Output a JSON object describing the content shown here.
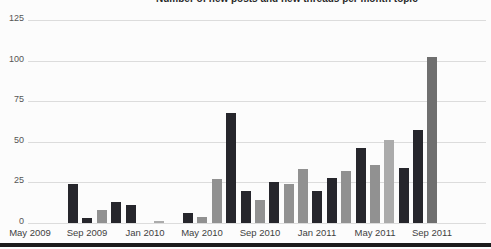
{
  "title_clipped": "Number of new posts and new threads per month topic",
  "colors": {
    "dark": "#26262c",
    "gray": "#919191",
    "lightgray": "#ababab",
    "darkgray": "#6f6f6f",
    "gridline": "#dcdcdc",
    "axis_text": "#555555",
    "bottom_bar": "#1b1b1b",
    "background": "#fcfcfc"
  },
  "chart_data": {
    "type": "bar",
    "ylabel": "",
    "xlabel": "",
    "ylim": [
      0,
      125
    ],
    "y_ticks": [
      0,
      25,
      50,
      75,
      100,
      125
    ],
    "grid": "horizontal",
    "legend": "none",
    "x_tick_labels": [
      "May 2009",
      "Sep 2009",
      "Jan 2010",
      "May 2010",
      "Sep 2010",
      "Jan 2011",
      "May 2011",
      "Sep 2011"
    ],
    "months": [
      {
        "label": "May 2009",
        "value": 0,
        "color": null
      },
      {
        "label": "Jun 2009",
        "value": 0,
        "color": null
      },
      {
        "label": "Jul 2009",
        "value": 0,
        "color": null
      },
      {
        "label": "Aug 2009",
        "value": 24,
        "color": "dark"
      },
      {
        "label": "Sep 2009",
        "value": 3,
        "color": "dark"
      },
      {
        "label": "Oct 2009",
        "value": 8,
        "color": "gray"
      },
      {
        "label": "Nov 2009",
        "value": 13,
        "color": "dark"
      },
      {
        "label": "Dec 2009",
        "value": 11,
        "color": "dark"
      },
      {
        "label": "Jan 2010",
        "value": 0,
        "color": null
      },
      {
        "label": "Feb 2010",
        "value": 1,
        "color": "lightgray"
      },
      {
        "label": "Mar 2010",
        "value": 0,
        "color": null
      },
      {
        "label": "Apr 2010",
        "value": 6,
        "color": "dark"
      },
      {
        "label": "May 2010",
        "value": 4,
        "color": "gray"
      },
      {
        "label": "Jun 2010",
        "value": 27,
        "color": "gray"
      },
      {
        "label": "Jul 2010",
        "value": 68,
        "color": "dark"
      },
      {
        "label": "Aug 2010",
        "value": 20,
        "color": "dark"
      },
      {
        "label": "Sep 2010",
        "value": 14,
        "color": "gray"
      },
      {
        "label": "Oct 2010",
        "value": 25,
        "color": "dark"
      },
      {
        "label": "Nov 2010",
        "value": 24,
        "color": "gray"
      },
      {
        "label": "Dec 2010",
        "value": 33,
        "color": "gray"
      },
      {
        "label": "Jan 2011",
        "value": 20,
        "color": "dark"
      },
      {
        "label": "Feb 2011",
        "value": 28,
        "color": "dark"
      },
      {
        "label": "Mar 2011",
        "value": 32,
        "color": "gray"
      },
      {
        "label": "Apr 2011",
        "value": 46,
        "color": "dark"
      },
      {
        "label": "May 2011",
        "value": 36,
        "color": "gray"
      },
      {
        "label": "Jun 2011",
        "value": 51,
        "color": "lightgray"
      },
      {
        "label": "Jul 2011",
        "value": 34,
        "color": "dark"
      },
      {
        "label": "Aug 2011",
        "value": 57,
        "color": "dark"
      },
      {
        "label": "Sep 2011",
        "value": 102,
        "color": "darkgray"
      }
    ]
  }
}
